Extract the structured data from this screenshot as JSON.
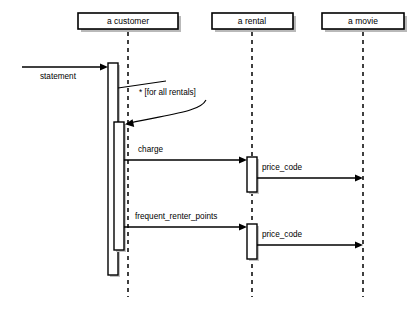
{
  "diagram": {
    "type": "uml-sequence-diagram",
    "background_color": "#ffffff",
    "line_color": "#000000",
    "shadow_color": "#b9b9b9",
    "participants": [
      {
        "id": "customer",
        "label": "a customer",
        "lifeline_x": 128
      },
      {
        "id": "rental",
        "label": "a rental",
        "lifeline_x": 252
      },
      {
        "id": "movie",
        "label": "a movie",
        "lifeline_x": 363
      }
    ],
    "messages": [
      {
        "id": "statement",
        "label": "statement",
        "from": "actor",
        "to": "customer"
      },
      {
        "id": "charge",
        "label": "charge",
        "from": "customer",
        "to": "rental"
      },
      {
        "id": "price_code_1",
        "label": "price_code",
        "from": "rental",
        "to": "movie"
      },
      {
        "id": "frequent_renter_points",
        "label": "frequent_renter_points",
        "from": "customer",
        "to": "rental"
      },
      {
        "id": "price_code_2",
        "label": "price_code",
        "from": "rental",
        "to": "movie"
      }
    ],
    "notes": [
      {
        "id": "iteration-note",
        "label": "* [for all rentals]"
      }
    ]
  }
}
